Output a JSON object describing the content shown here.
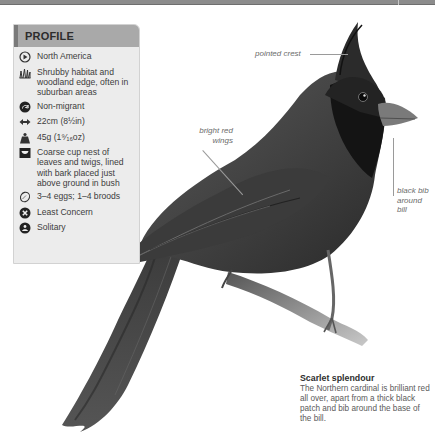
{
  "profile": {
    "title": "PROFILE",
    "items": [
      {
        "icon": "globe-range-icon",
        "text": "North America"
      },
      {
        "icon": "grass-habitat-icon",
        "text": "Shrubby habitat and woodland edge, often in suburban areas"
      },
      {
        "icon": "migration-arrow-icon",
        "text": "Non-migrant"
      },
      {
        "icon": "length-arrows-icon",
        "text": "22cm (8½in)"
      },
      {
        "icon": "weight-icon",
        "text": "45g (1⁹⁄₁₆oz)"
      },
      {
        "icon": "nest-icon",
        "text": "Coarse cup nest of leaves and twigs, lined with bark placed just above ground in bush"
      },
      {
        "icon": "egg-icon",
        "text": "3–4 eggs; 1–4 broods"
      },
      {
        "icon": "conservation-status-icon",
        "text": "Least Concern"
      },
      {
        "icon": "social-behaviour-icon",
        "text": "Solitary"
      }
    ]
  },
  "annotations": {
    "crest": "pointed crest",
    "wings": "bright red wings",
    "bib": "black bib around bill"
  },
  "caption": {
    "title": "Scarlet splendour",
    "body": "The Northern cardinal is brilliant red all over, apart from a thick black patch and bib around the base of the bill."
  },
  "colors": {
    "panel_bg": "#ececec",
    "panel_header": "#a9a9a9",
    "bird_dark": "#1e1e1e",
    "bird_mid": "#4a4a4a"
  }
}
